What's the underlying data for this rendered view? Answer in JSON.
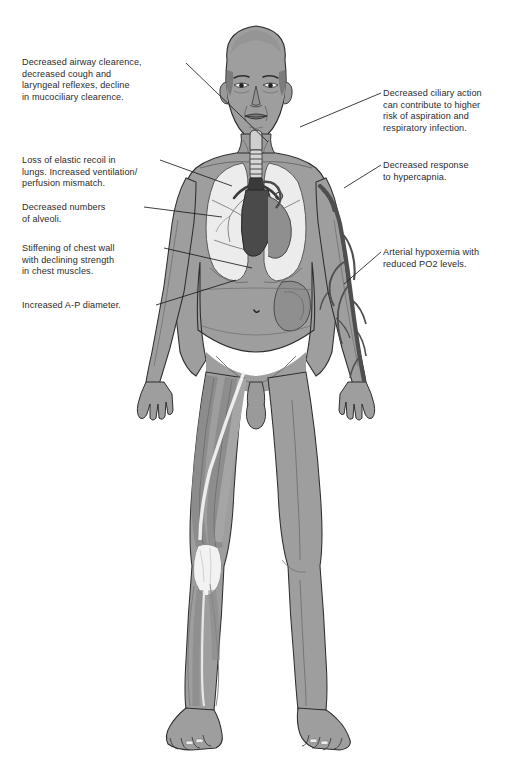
{
  "diagram": {
    "background_color": "#ffffff",
    "text_color": "#2b2b2b",
    "leader_line_color": "#1c1c1c",
    "palette": {
      "skin": "#9e9e9e",
      "skin_shadow": "#8a8a8a",
      "lung": "#ececec",
      "lung_outline": "#5a5a5a",
      "heart_dark": "#4a4a4a",
      "trachea_dark": "#3a3a3a",
      "stomach": "#8f8f8f",
      "vessel_dark": "#4f4f4f",
      "muscle": "#a5a5a5",
      "tendon_light": "#f2f2f2",
      "outline": "#2e2e2e"
    },
    "annotations": [
      {
        "id": "airway-clearance",
        "side": "left",
        "text": "Decreased airway clearence,\ndecreased cough and\nlaryngeal reflexes, decline\nin mucociliary clearence."
      },
      {
        "id": "ciliary-action",
        "side": "right",
        "text": "Decreased ciliary action\ncan contribute to higher\nrisk of aspiration and\nrespiratory infection."
      },
      {
        "id": "elastic-recoil",
        "side": "left",
        "text": "Loss of elastic recoil in\nlungs. Increased ventilation/\nperfusion mismatch."
      },
      {
        "id": "alveoli",
        "side": "left",
        "text": "Decreased numbers\nof alveoli."
      },
      {
        "id": "hypercapnia",
        "side": "right",
        "text": "Decreased response\nto hypercapnia."
      },
      {
        "id": "chest-wall",
        "side": "left",
        "text": "Stiffening of chest wall\nwith declining strength\nin chest muscles."
      },
      {
        "id": "arterial-hypoxemia",
        "side": "right",
        "text": "Arterial hypoxemia with\nreduced PO2 levels."
      },
      {
        "id": "ap-diameter",
        "side": "left",
        "text": "Increased A-P diameter."
      }
    ],
    "anatomy_parts": [
      "head",
      "face",
      "neck",
      "trachea",
      "larynx",
      "bronchi",
      "right-lung",
      "left-lung",
      "heart",
      "aortic-arch",
      "stomach",
      "torso",
      "abdomen",
      "umbilicus",
      "left-arm",
      "right-arm",
      "brachial-vessels",
      "pelvis",
      "penis",
      "scrotum",
      "right-thigh-muscles",
      "quadriceps",
      "patellar-tendon",
      "right-lower-leg-muscles",
      "tibialis-anterior",
      "left-leg",
      "left-foot",
      "right-foot",
      "toes"
    ]
  }
}
